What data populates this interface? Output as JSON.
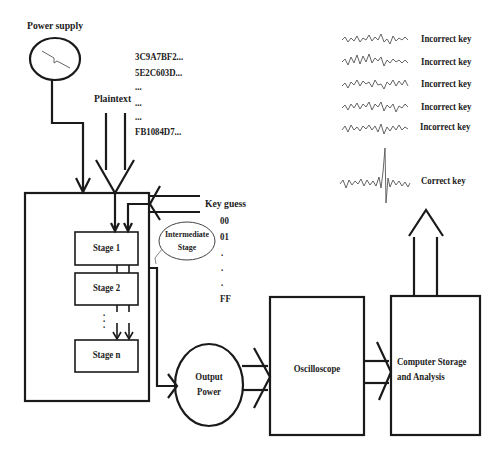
{
  "diagram": {
    "power_supply": {
      "label": "Power supply"
    },
    "plaintext": {
      "label": "Plaintext",
      "values": [
        "3C9A7BF2...",
        "5E2C603D...",
        "...",
        "...",
        "...",
        "FB1084D7..."
      ]
    },
    "key_guess": {
      "label": "Key guess",
      "values": [
        "00",
        "01",
        ".",
        ".",
        ".",
        "FF"
      ]
    },
    "stages": [
      "Stage 1",
      "Stage 2",
      "Stage n"
    ],
    "intermediate": {
      "label_line1": "Intermediate",
      "label_line2": "Stage"
    },
    "output_power": {
      "line1": "Output",
      "line2": "Power"
    },
    "oscilloscope": {
      "label": "Oscilloscope"
    },
    "computer": {
      "line1": "Computer Storage",
      "line2": "and Analysis"
    },
    "results": [
      {
        "label": "Incorrect key",
        "type": "noise"
      },
      {
        "label": "Incorrect key",
        "type": "noise"
      },
      {
        "label": "Incorrect key",
        "type": "noise"
      },
      {
        "label": "Incorrect key",
        "type": "noise"
      },
      {
        "label": "Incorrect key",
        "type": "noise"
      },
      {
        "label": "Correct key",
        "type": "peak"
      }
    ],
    "colors": {
      "line": "#1a1a1a",
      "trace": "#555555",
      "background": "#ffffff"
    }
  }
}
